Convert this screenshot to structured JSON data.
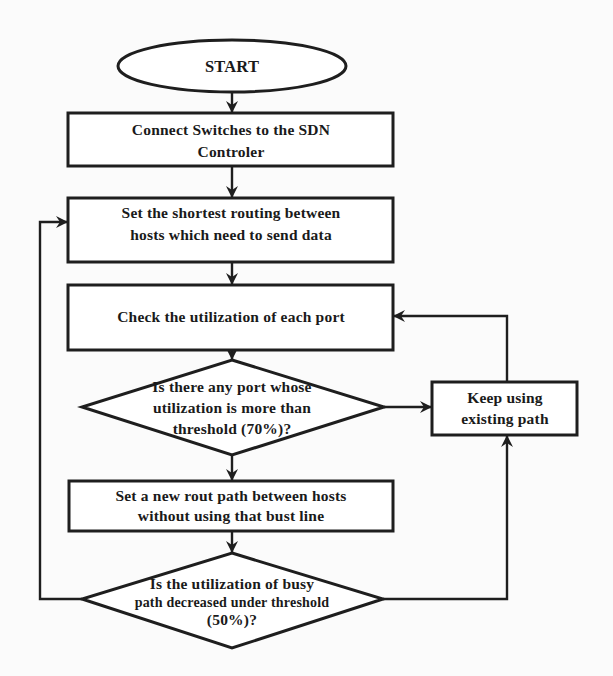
{
  "diagram": {
    "type": "flowchart",
    "colors": {
      "stroke": "#1e1e1e",
      "text": "#1a1a1a",
      "fill": "#ffffff",
      "background": "#fbfbfb"
    },
    "nodes": {
      "start": {
        "shape": "ellipse",
        "lines": [
          "START"
        ]
      },
      "connect": {
        "shape": "rect",
        "lines": [
          "Connect Switches to the SDN",
          "Controler"
        ]
      },
      "shortest": {
        "shape": "rect",
        "lines": [
          "Set the shortest routing between",
          "hosts which need to send data"
        ]
      },
      "check": {
        "shape": "rect",
        "lines": [
          "Check the utilization of each port"
        ]
      },
      "decision1": {
        "shape": "diamond",
        "lines": [
          "Is there any port whose",
          "utilization is more than",
          "threshold (70%)?"
        ]
      },
      "keep": {
        "shape": "rect",
        "lines": [
          "Keep using",
          "existing path"
        ]
      },
      "newpath": {
        "shape": "rect",
        "lines": [
          "Set a new rout path between hosts",
          "without using that bust line"
        ]
      },
      "decision2": {
        "shape": "diamond",
        "lines": [
          "Is the utilization of busy",
          "path decreased under threshold",
          "(50%)?"
        ]
      }
    },
    "edges": [
      {
        "from": "start",
        "to": "connect"
      },
      {
        "from": "connect",
        "to": "shortest"
      },
      {
        "from": "shortest",
        "to": "check"
      },
      {
        "from": "check",
        "to": "decision1"
      },
      {
        "from": "decision1",
        "to": "keep",
        "side": "right"
      },
      {
        "from": "decision1",
        "to": "newpath",
        "side": "bottom"
      },
      {
        "from": "keep",
        "to": "check",
        "side": "top"
      },
      {
        "from": "newpath",
        "to": "decision2"
      },
      {
        "from": "decision2",
        "to": "shortest",
        "side": "left"
      },
      {
        "from": "decision2",
        "to": "keep",
        "side": "right"
      }
    ]
  }
}
